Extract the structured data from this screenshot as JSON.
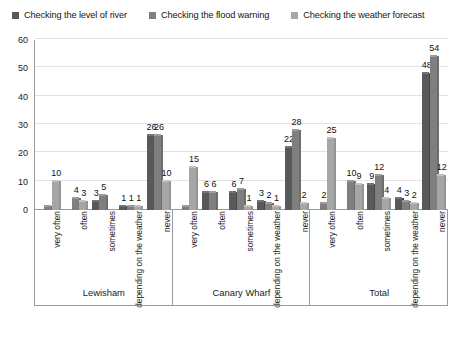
{
  "chart_data": {
    "type": "bar",
    "title": "",
    "xlabel": "",
    "ylabel": "",
    "ylim": [
      0,
      60
    ],
    "ytick_step": 10,
    "yticks": [
      0,
      10,
      20,
      30,
      40,
      50,
      60
    ],
    "grid": true,
    "legend_position": "top",
    "categories": [
      "very often",
      "often",
      "sometimes",
      "depending on the weather",
      "never"
    ],
    "groups": [
      "Lewisham",
      "Canary Wharf",
      "Total"
    ],
    "series": [
      {
        "name": "Checking the level of river",
        "color": "#595959",
        "values": {
          "Lewisham": [
            0,
            0,
            3,
            1,
            26
          ],
          "Canary Wharf": [
            0,
            6,
            6,
            3,
            22
          ],
          "Total": [
            0,
            0,
            9,
            4,
            48
          ]
        },
        "labels": {
          "Lewisham": [
            "",
            "",
            "3",
            "1",
            "26"
          ],
          "Canary Wharf": [
            "",
            "6",
            "6",
            "3",
            "22"
          ],
          "Total": [
            "",
            "",
            "9",
            "4",
            "48"
          ]
        }
      },
      {
        "name": "Checking the flood warning",
        "color": "#7f7f7f",
        "values": {
          "Lewisham": [
            1,
            4,
            5,
            1,
            26
          ],
          "Canary Wharf": [
            1,
            6,
            7,
            2,
            28
          ],
          "Total": [
            2,
            10,
            12,
            3,
            54
          ]
        },
        "labels": {
          "Lewisham": [
            "",
            "4",
            "5",
            "1",
            "26"
          ],
          "Canary Wharf": [
            "",
            "6",
            "7",
            "2",
            "28"
          ],
          "Total": [
            "2",
            "10",
            "12",
            "3",
            "54"
          ]
        }
      },
      {
        "name": "Checking the weather forecast",
        "color": "#a6a6a6",
        "values": {
          "Lewisham": [
            10,
            3,
            0,
            1,
            10
          ],
          "Canary Wharf": [
            15,
            0,
            1,
            1,
            2
          ],
          "Total": [
            25,
            9,
            4,
            2,
            12
          ]
        },
        "labels": {
          "Lewisham": [
            "10",
            "3",
            "",
            "1",
            "10"
          ],
          "Canary Wharf": [
            "15",
            "",
            "1",
            "1",
            "2"
          ],
          "Total": [
            "25",
            "9",
            "4",
            "2",
            "12"
          ]
        }
      }
    ]
  },
  "legend": {
    "items": [
      {
        "label": "Checking the level of river",
        "color": "#595959",
        "swatch": "square-marker-icon"
      },
      {
        "label": "Checking the flood warning",
        "color": "#7f7f7f",
        "swatch": "square-marker-icon"
      },
      {
        "label": "Checking the weather forecast",
        "color": "#a6a6a6",
        "swatch": "square-marker-icon"
      }
    ]
  },
  "axes": {
    "y_ticks": [
      "0",
      "10",
      "20",
      "30",
      "40",
      "50",
      "60"
    ],
    "category_labels": [
      "very often",
      "often",
      "sometimes",
      "depending on the weather",
      "never"
    ],
    "group_labels": [
      "Lewisham",
      "Canary Wharf",
      "Total"
    ]
  },
  "colors": {
    "series1": "#595959",
    "series2": "#7f7f7f",
    "series3": "#a6a6a6",
    "grid": "#e2e2e2",
    "axis": "#9a9a9a",
    "text": "#1a1a1a",
    "background": "#ffffff"
  }
}
